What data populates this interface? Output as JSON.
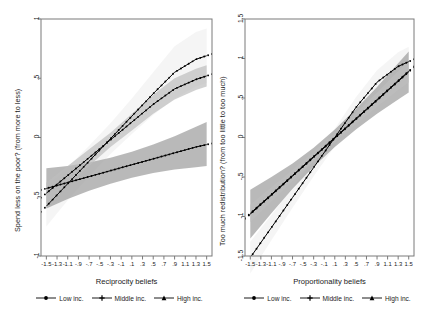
{
  "figure": {
    "kind": "two-panel marginal-effects plot",
    "background": "#ffffff",
    "line_color": "#000000",
    "ci_colors": {
      "low": "#9e9e9e",
      "middle": "#bdbdbd",
      "high": "#ededed"
    }
  },
  "chart_data": [
    {
      "type": "line",
      "panel": "left",
      "title": "",
      "xlabel": "Reciprocity beliefs",
      "ylabel": "Spend less on the poor? (from more to less)",
      "xlim": [
        -1.6,
        1.6
      ],
      "ylim": [
        -1,
        1
      ],
      "grid": false,
      "legend_position": "bottom",
      "xticks": [
        "-1.5",
        "-1.3",
        "-1.1",
        "-.9",
        "-.7",
        "-.5",
        "-.3",
        "-.1",
        ".1",
        ".3",
        ".5",
        ".7",
        ".9",
        "1.1",
        "1.3",
        "1.5"
      ],
      "xtick_values": [
        -1.5,
        -1.3,
        -1.1,
        -0.9,
        -0.7,
        -0.5,
        -0.3,
        -0.1,
        0.1,
        0.3,
        0.5,
        0.7,
        0.9,
        1.1,
        1.3,
        1.5
      ],
      "yticks": [
        "1",
        ".5",
        "0",
        "-.5",
        "-1"
      ],
      "ytick_values": [
        1,
        0.5,
        0,
        -0.5,
        -1
      ],
      "x": [
        -1.5,
        -1.1,
        -0.7,
        -0.3,
        0.1,
        0.5,
        0.9,
        1.3,
        1.5
      ],
      "series": [
        {
          "name": "Low inc.",
          "marker": "circle",
          "values": [
            -0.43,
            -0.38,
            -0.33,
            -0.28,
            -0.23,
            -0.18,
            -0.13,
            -0.08,
            -0.06
          ],
          "ci_lower": [
            -0.6,
            -0.52,
            -0.45,
            -0.39,
            -0.34,
            -0.3,
            -0.27,
            -0.25,
            -0.24
          ],
          "ci_upper": [
            -0.26,
            -0.24,
            -0.21,
            -0.17,
            -0.12,
            -0.06,
            0.01,
            0.09,
            0.13
          ]
        },
        {
          "name": "Middle inc.",
          "marker": "plus",
          "values": [
            -0.47,
            -0.32,
            -0.17,
            -0.02,
            0.13,
            0.28,
            0.41,
            0.49,
            0.52
          ],
          "ci_lower": [
            -0.56,
            -0.4,
            -0.24,
            -0.08,
            0.06,
            0.2,
            0.32,
            0.4,
            0.43
          ],
          "ci_upper": [
            -0.38,
            -0.24,
            -0.1,
            0.04,
            0.2,
            0.36,
            0.5,
            0.58,
            0.61
          ]
        },
        {
          "name": "High inc.",
          "marker": "triangle",
          "values": [
            -0.58,
            -0.39,
            -0.2,
            -0.01,
            0.18,
            0.37,
            0.55,
            0.66,
            0.69
          ],
          "ci_lower": [
            -0.75,
            -0.53,
            -0.33,
            -0.14,
            0.03,
            0.19,
            0.33,
            0.43,
            0.46
          ],
          "ci_upper": [
            -0.41,
            -0.25,
            -0.07,
            0.12,
            0.33,
            0.55,
            0.77,
            0.89,
            0.92
          ]
        }
      ]
    },
    {
      "type": "line",
      "panel": "right",
      "title": "",
      "xlabel": "Proportionality beliefs",
      "ylabel": "Too much redistribution? (from too little to too much)",
      "xlim": [
        -1.6,
        1.6
      ],
      "ylim": [
        -1.5,
        1.5
      ],
      "grid": false,
      "legend_position": "bottom",
      "xticks": [
        "-1.5",
        "-1.3",
        "-1.1",
        "-.9",
        "-.7",
        "-.5",
        "-.3",
        "-.1",
        ".1",
        ".3",
        ".5",
        ".7",
        ".9",
        "1.1",
        "1.3",
        "1.5"
      ],
      "xtick_values": [
        -1.5,
        -1.3,
        -1.1,
        -0.9,
        -0.7,
        -0.5,
        -0.3,
        -0.1,
        0.1,
        0.3,
        0.5,
        0.7,
        0.9,
        1.1,
        1.3,
        1.5
      ],
      "yticks": [
        "1.5",
        "1",
        ".5",
        "0",
        "-.5",
        "-1",
        "-1.5"
      ],
      "ytick_values": [
        1.5,
        1,
        0.5,
        0,
        -0.5,
        -1,
        -1.5
      ],
      "x": [
        -1.5,
        -1.1,
        -0.7,
        -0.3,
        0.1,
        0.5,
        0.9,
        1.3,
        1.5
      ],
      "series": [
        {
          "name": "Low inc.",
          "marker": "circle",
          "values": [
            -0.97,
            -0.73,
            -0.49,
            -0.25,
            -0.01,
            0.23,
            0.47,
            0.71,
            0.83
          ],
          "ci_lower": [
            -1.28,
            -0.96,
            -0.65,
            -0.37,
            -0.12,
            0.1,
            0.3,
            0.48,
            0.57
          ],
          "ci_upper": [
            -0.66,
            -0.5,
            -0.33,
            -0.13,
            0.1,
            0.36,
            0.64,
            0.94,
            1.09
          ]
        },
        {
          "name": "Middle inc.",
          "marker": "plus",
          "values": [
            -0.96,
            -0.72,
            -0.48,
            -0.24,
            0.0,
            0.24,
            0.48,
            0.72,
            0.84
          ],
          "ci_lower": [
            -1.07,
            -0.81,
            -0.55,
            -0.3,
            -0.06,
            0.17,
            0.39,
            0.6,
            0.7
          ],
          "ci_upper": [
            -0.85,
            -0.63,
            -0.41,
            -0.18,
            0.06,
            0.31,
            0.57,
            0.84,
            0.98
          ]
        },
        {
          "name": "High inc.",
          "marker": "triangle",
          "values": [
            -1.52,
            -1.14,
            -0.76,
            -0.38,
            0.0,
            0.38,
            0.7,
            0.9,
            0.96
          ],
          "ci_lower": [
            -1.72,
            -1.3,
            -0.89,
            -0.49,
            -0.11,
            0.25,
            0.55,
            0.72,
            0.77
          ],
          "ci_upper": [
            -1.32,
            -0.98,
            -0.63,
            -0.27,
            0.11,
            0.51,
            0.85,
            1.08,
            1.15
          ]
        }
      ]
    }
  ],
  "panels": {
    "left": {
      "ylabel": "Spend less on the poor? (from more to less)",
      "xlabel": "Reciprocity beliefs",
      "yticks": [
        "1",
        ".5",
        "0",
        "-.5",
        "-1"
      ],
      "xticks": [
        "-1.5",
        "-1.3",
        "-1.1",
        "-.9",
        "-.7",
        "-.5",
        "-.3",
        "-.1",
        ".1",
        ".3",
        ".5",
        ".7",
        ".9",
        "1.1",
        "1.3",
        "1.5"
      ],
      "legend": [
        {
          "label": "Low inc.",
          "marker": "circle"
        },
        {
          "label": "Middle inc.",
          "marker": "plus"
        },
        {
          "label": "High inc.",
          "marker": "triangle"
        }
      ]
    },
    "right": {
      "ylabel": "Too much redistribution? (from too little to too much)",
      "xlabel": "Proportionality beliefs",
      "yticks": [
        "1.5",
        "1",
        ".5",
        "0",
        "-.5",
        "-1",
        "-1.5"
      ],
      "xticks": [
        "-1.5",
        "-1.3",
        "-1.1",
        "-.9",
        "-.7",
        "-.5",
        "-.3",
        "-.1",
        ".1",
        ".3",
        ".5",
        ".7",
        ".9",
        "1.1",
        "1.3",
        "1.5"
      ],
      "legend": [
        {
          "label": "Low inc.",
          "marker": "circle"
        },
        {
          "label": "Middle inc.",
          "marker": "plus"
        },
        {
          "label": "High inc.",
          "marker": "triangle"
        }
      ]
    }
  }
}
